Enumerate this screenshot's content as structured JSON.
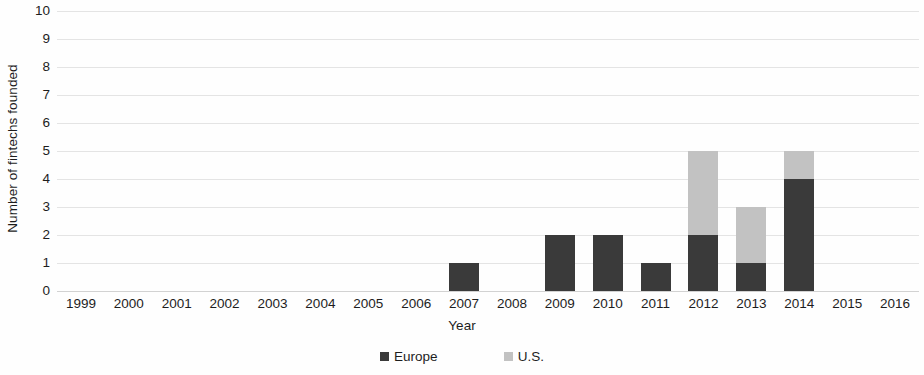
{
  "chart_data": {
    "type": "bar",
    "subtype": "stacked-bar",
    "title": "",
    "xlabel": "Year",
    "ylabel": "Number of fintechs founded",
    "categories": [
      "1999",
      "2000",
      "2001",
      "2002",
      "2003",
      "2004",
      "2005",
      "2006",
      "2007",
      "2008",
      "2009",
      "2010",
      "2011",
      "2012",
      "2013",
      "2014",
      "2015",
      "2016"
    ],
    "series": [
      {
        "name": "Europe",
        "color": "#3a3a3a",
        "values": [
          0,
          0,
          0,
          0,
          0,
          0,
          0,
          0,
          1,
          0,
          2,
          2,
          1,
          2,
          1,
          4,
          0,
          0
        ]
      },
      {
        "name": "U.S.",
        "color": "#c2c2c2",
        "values": [
          0,
          0,
          0,
          0,
          0,
          0,
          0,
          0,
          0,
          0,
          0,
          0,
          0,
          3,
          2,
          1,
          0,
          0
        ]
      }
    ],
    "totals": [
      0,
      0,
      0,
      0,
      0,
      0,
      0,
      0,
      1,
      0,
      2,
      2,
      1,
      5,
      3,
      5,
      0,
      0
    ],
    "ylim": [
      0,
      10
    ],
    "ytick_values": [
      10,
      9,
      8,
      7,
      6,
      5,
      4,
      3,
      2,
      1,
      0
    ],
    "ytick_labels": [
      "10",
      "9",
      "8",
      "7",
      "6",
      "5",
      "4",
      "3",
      "2",
      "1",
      "0"
    ],
    "ystep": 1,
    "grid": true,
    "grid_axis": "y",
    "grid_color": "#e4e4e4",
    "legend_position": "bottom-center",
    "legend": [
      {
        "label": "Europe",
        "color": "#3a3a3a",
        "marker": "square"
      },
      {
        "label": "U.S.",
        "color": "#c2c2c2",
        "marker": "square"
      }
    ]
  }
}
